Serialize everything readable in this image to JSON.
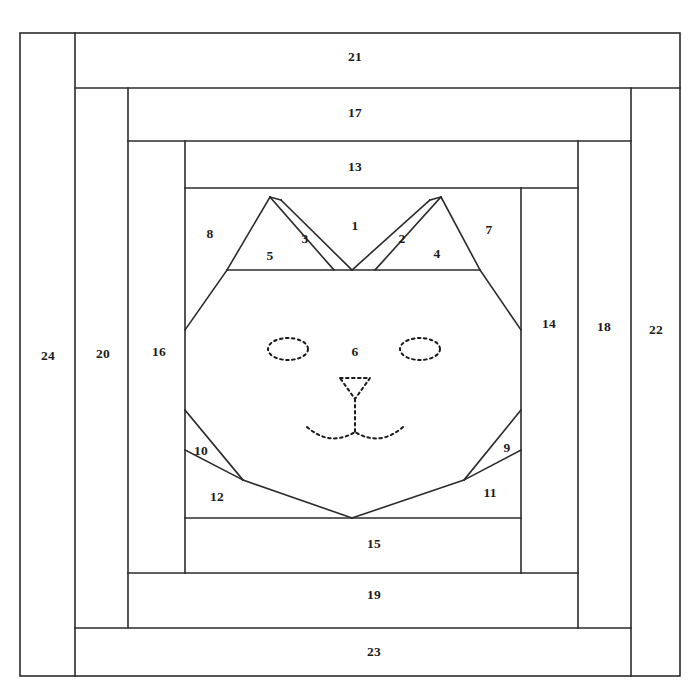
{
  "document": {
    "title": "Cat Face Log Cabin Paper-Piecing Pattern",
    "background_color": "#ffffff",
    "line_color": "#2b2b2b",
    "label_color": "#1c1c1c",
    "width": 700,
    "height": 700
  },
  "patch_labels": [
    {
      "id": "1",
      "text": "1",
      "x": 355,
      "y": 227
    },
    {
      "id": "2",
      "text": "2",
      "x": 402,
      "y": 240
    },
    {
      "id": "3",
      "text": "3",
      "x": 305,
      "y": 240
    },
    {
      "id": "4",
      "text": "4",
      "x": 437,
      "y": 255
    },
    {
      "id": "5",
      "text": "5",
      "x": 270,
      "y": 257
    },
    {
      "id": "6",
      "text": "6",
      "x": 355,
      "y": 353
    },
    {
      "id": "7",
      "text": "7",
      "x": 489,
      "y": 231
    },
    {
      "id": "8",
      "text": "8",
      "x": 210,
      "y": 235
    },
    {
      "id": "9",
      "text": "9",
      "x": 507,
      "y": 449
    },
    {
      "id": "10",
      "text": "10",
      "x": 201,
      "y": 452
    },
    {
      "id": "11",
      "text": "11",
      "x": 490,
      "y": 494
    },
    {
      "id": "12",
      "text": "12",
      "x": 217,
      "y": 498
    },
    {
      "id": "13",
      "text": "13",
      "x": 355,
      "y": 168
    },
    {
      "id": "14",
      "text": "14",
      "x": 549,
      "y": 325
    },
    {
      "id": "15",
      "text": "15",
      "x": 374,
      "y": 545
    },
    {
      "id": "16",
      "text": "16",
      "x": 159,
      "y": 353
    },
    {
      "id": "17",
      "text": "17",
      "x": 355,
      "y": 114
    },
    {
      "id": "18",
      "text": "18",
      "x": 604,
      "y": 328
    },
    {
      "id": "19",
      "text": "19",
      "x": 374,
      "y": 596
    },
    {
      "id": "20",
      "text": "20",
      "x": 103,
      "y": 355
    },
    {
      "id": "21",
      "text": "21",
      "x": 355,
      "y": 58
    },
    {
      "id": "22",
      "text": "22",
      "x": 656,
      "y": 331
    },
    {
      "id": "23",
      "text": "23",
      "x": 374,
      "y": 653
    },
    {
      "id": "24",
      "text": "24",
      "x": 48,
      "y": 357
    }
  ],
  "pattern_geometry": {
    "outer_frame": {
      "x1": 20,
      "y1": 33,
      "x2": 680,
      "y2": 676
    },
    "rings": [
      {
        "name": "ring-24-21-22-23",
        "left": 20,
        "top": 33,
        "right": 680,
        "bottom": 676
      },
      {
        "name": "ring-20-17-18-19",
        "left": 75,
        "top": 88,
        "right": 631,
        "bottom": 628
      },
      {
        "name": "ring-16-13-14-15",
        "left": 128,
        "top": 141,
        "right": 578,
        "bottom": 573
      },
      {
        "name": "center-block",
        "left": 185,
        "top": 188,
        "right": 521,
        "bottom": 518
      }
    ],
    "face_block": {
      "left": 185,
      "top": 188,
      "right": 521,
      "bottom": 518
    },
    "ear_band_bottom_y": 270,
    "left_ear_apex": {
      "x": 270,
      "y": 197
    },
    "right_ear_apex": {
      "x": 441,
      "y": 197
    },
    "valley_point": {
      "x": 352,
      "y": 270
    },
    "chin_point": {
      "x": 352,
      "y": 518
    },
    "left_cheek_point": {
      "x": 185,
      "y": 330
    },
    "right_cheek_point": {
      "x": 521,
      "y": 330
    },
    "left_leg_break": {
      "x": 185,
      "y": 410
    },
    "right_leg_break": {
      "x": 521,
      "y": 410
    },
    "left_paw_inner": {
      "x": 243,
      "y": 480
    },
    "right_paw_inner": {
      "x": 464,
      "y": 480
    },
    "left_paw_edge": {
      "x": 185,
      "y": 450
    },
    "right_paw_edge": {
      "x": 521,
      "y": 450
    }
  },
  "face_features": {
    "left_eye": {
      "cx": 288,
      "cy": 349,
      "rx": 20,
      "ry": 11,
      "style": "dashed-ellipse"
    },
    "right_eye": {
      "cx": 420,
      "cy": 349,
      "rx": 20,
      "ry": 11,
      "style": "dashed-ellipse"
    },
    "nose": {
      "style": "dashed-triangle",
      "top_left_x": 340,
      "top_right_x": 370,
      "top_y": 378,
      "tip_x": 355,
      "tip_y": 399
    },
    "mouth": {
      "style": "dashed-double-curve",
      "center_x": 355,
      "center_y": 432,
      "left_end_x": 307,
      "right_end_x": 403
    }
  }
}
